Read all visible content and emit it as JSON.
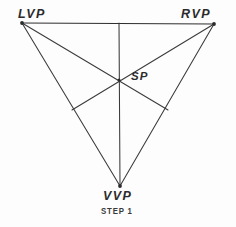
{
  "figure": {
    "caption": "STEP 1",
    "background_color": "#fdfdfd",
    "ink_color": "#2b2b2d",
    "width": 236,
    "height": 227
  },
  "labels": {
    "left_vanishing_point": "LVP",
    "right_vanishing_point": "RVP",
    "station_point": "SP",
    "vertical_vanishing_point": "VVP"
  },
  "chart_data": {
    "type": "diagram",
    "title": "STEP 1",
    "subtitle": "",
    "xlabel": "",
    "ylabel": "",
    "grid": false,
    "legend": "none",
    "xlim": [
      0,
      236
    ],
    "ylim": [
      0,
      227
    ],
    "points": [
      {
        "name": "LVP",
        "label": "LVP",
        "x": 22,
        "y": 23,
        "role": "vertex"
      },
      {
        "name": "RVP",
        "label": "RVP",
        "x": 214,
        "y": 24,
        "role": "vertex"
      },
      {
        "name": "VVP",
        "label": "VVP",
        "x": 120,
        "y": 186,
        "role": "vertex"
      },
      {
        "name": "SP",
        "label": "SP",
        "x": 119,
        "y": 80,
        "role": "orthocenter"
      },
      {
        "name": "foot-horizon",
        "label": "",
        "x": 119,
        "y": 23,
        "role": "altitude-foot"
      },
      {
        "name": "foot-left",
        "label": "",
        "x": 72,
        "y": 110,
        "role": "altitude-foot"
      },
      {
        "name": "foot-right",
        "label": "",
        "x": 168,
        "y": 110,
        "role": "altitude-foot"
      }
    ],
    "segments": [
      {
        "name": "horizon-line",
        "from": "LVP",
        "to": "RVP",
        "x1": 22,
        "y1": 23,
        "x2": 214,
        "y2": 24,
        "weight": "heavy"
      },
      {
        "name": "left-leg",
        "from": "LVP",
        "to": "VVP",
        "x1": 22,
        "y1": 23,
        "x2": 120,
        "y2": 186,
        "weight": "normal"
      },
      {
        "name": "right-leg",
        "from": "RVP",
        "to": "VVP",
        "x1": 214,
        "y1": 24,
        "x2": 120,
        "y2": 186,
        "weight": "normal"
      },
      {
        "name": "vertical-altitude",
        "from": "foot-horizon",
        "to": "VVP",
        "x1": 119,
        "y1": 23,
        "x2": 120,
        "y2": 186,
        "weight": "normal"
      },
      {
        "name": "altitude-from-lvp",
        "from": "LVP",
        "to": "foot-right",
        "x1": 22,
        "y1": 23,
        "x2": 168,
        "y2": 110,
        "weight": "normal"
      },
      {
        "name": "altitude-from-rvp",
        "from": "RVP",
        "to": "foot-left",
        "x1": 214,
        "y1": 24,
        "x2": 72,
        "y2": 110,
        "weight": "normal"
      }
    ]
  }
}
